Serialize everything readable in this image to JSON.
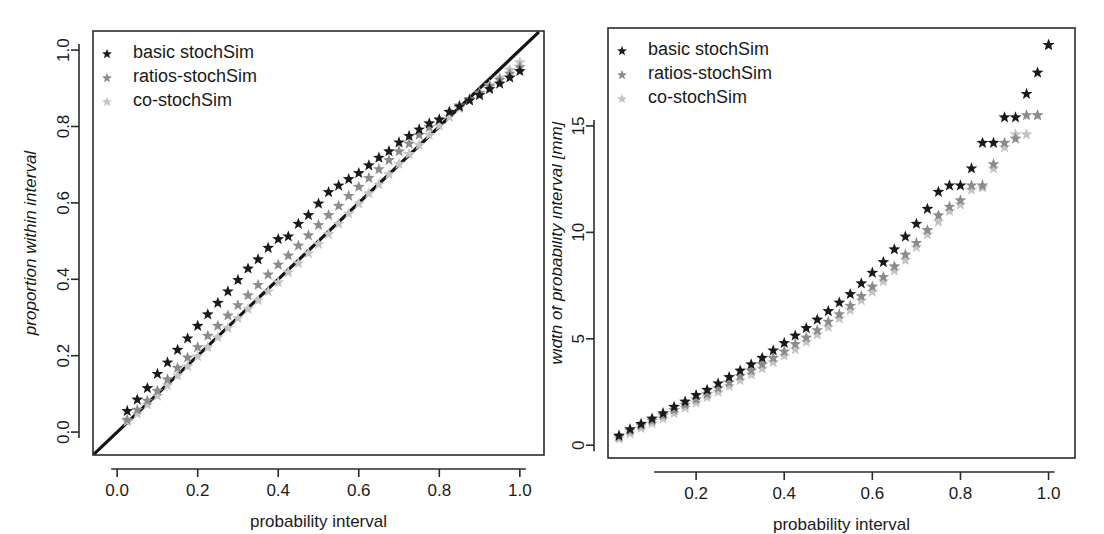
{
  "figure": {
    "background": "#ffffff",
    "panels": [
      "calibration-plot",
      "interval-width-plot"
    ]
  },
  "series_style": {
    "basic": {
      "name": "basic stochSim",
      "color": "#1a1a1a"
    },
    "ratios": {
      "name": "ratios-stochSim",
      "color": "#8c8c8c"
    },
    "co": {
      "name": "co-stochSim",
      "color": "#c4c4c4"
    }
  },
  "legend": {
    "marker": "star-marker",
    "items": [
      {
        "label": "basic stochSim",
        "color": "#1a1a1a"
      },
      {
        "label": "ratios-stochSim",
        "color": "#8c8c8c"
      },
      {
        "label": "co-stochSim",
        "color": "#c4c4c4"
      }
    ]
  },
  "chart_data": [
    {
      "id": "calibration-plot",
      "type": "scatter",
      "title": "",
      "xlabel": "probability interval",
      "ylabel": "proportion within interval",
      "xlim": [
        -0.06,
        1.06
      ],
      "ylim": [
        -0.06,
        1.05
      ],
      "xticks": [
        0.0,
        0.2,
        0.4,
        0.6,
        0.8,
        1.0
      ],
      "xticklabels": [
        "0.0",
        "0.2",
        "0.4",
        "0.6",
        "0.8",
        "1.0"
      ],
      "yticks": [
        0.0,
        0.2,
        0.4,
        0.6,
        0.8,
        1.0
      ],
      "yticklabels": [
        "0.0",
        "0.2",
        "0.4",
        "0.6",
        "0.8",
        "1.0"
      ],
      "grid": false,
      "legend_position": "top-left",
      "reference_line": {
        "name": "identity-line",
        "from": [
          -0.055,
          -0.055
        ],
        "to": [
          1.045,
          1.045
        ]
      },
      "x": [
        0.025,
        0.05,
        0.075,
        0.1,
        0.125,
        0.15,
        0.175,
        0.2,
        0.225,
        0.25,
        0.275,
        0.3,
        0.325,
        0.35,
        0.375,
        0.4,
        0.425,
        0.45,
        0.475,
        0.5,
        0.525,
        0.55,
        0.575,
        0.6,
        0.625,
        0.65,
        0.675,
        0.7,
        0.725,
        0.75,
        0.775,
        0.8,
        0.825,
        0.85,
        0.875,
        0.9,
        0.925,
        0.95,
        0.975,
        1.0
      ],
      "series": [
        {
          "name": "basic stochSim",
          "color": "#1a1a1a",
          "values": [
            0.055,
            0.085,
            0.115,
            0.152,
            0.182,
            0.215,
            0.245,
            0.278,
            0.308,
            0.338,
            0.368,
            0.398,
            0.428,
            0.452,
            0.482,
            0.505,
            0.512,
            0.545,
            0.568,
            0.598,
            0.628,
            0.645,
            0.662,
            0.678,
            0.698,
            0.718,
            0.735,
            0.758,
            0.775,
            0.792,
            0.808,
            0.818,
            0.838,
            0.852,
            0.868,
            0.882,
            0.898,
            0.912,
            0.928,
            0.945
          ]
        },
        {
          "name": "ratios-stochSim",
          "color": "#8c8c8c",
          "values": [
            0.032,
            0.058,
            0.082,
            0.108,
            0.138,
            0.168,
            0.195,
            0.222,
            0.252,
            0.278,
            0.305,
            0.332,
            0.358,
            0.385,
            0.412,
            0.438,
            0.462,
            0.488,
            0.515,
            0.542,
            0.568,
            0.592,
            0.618,
            0.642,
            0.665,
            0.688,
            0.712,
            0.735,
            0.755,
            0.778,
            0.798,
            0.818,
            0.838,
            0.855,
            0.872,
            0.888,
            0.905,
            0.922,
            0.938,
            0.955
          ]
        },
        {
          "name": "co-stochSim",
          "color": "#c4c4c4",
          "values": [
            0.028,
            0.048,
            0.072,
            0.095,
            0.122,
            0.148,
            0.172,
            0.198,
            0.222,
            0.248,
            0.272,
            0.298,
            0.322,
            0.345,
            0.368,
            0.392,
            0.418,
            0.442,
            0.468,
            0.492,
            0.518,
            0.545,
            0.572,
            0.598,
            0.625,
            0.648,
            0.675,
            0.702,
            0.728,
            0.752,
            0.778,
            0.802,
            0.825,
            0.848,
            0.868,
            0.888,
            0.908,
            0.928,
            0.948,
            0.968
          ]
        }
      ]
    },
    {
      "id": "interval-width-plot",
      "type": "scatter",
      "title": "",
      "xlabel": "probability interval",
      "ylabel": "width of probability interval [mm]",
      "xlim": [
        0.0,
        1.06
      ],
      "ylim": [
        -0.6,
        19.6
      ],
      "xticks": [
        0.2,
        0.4,
        0.6,
        0.8,
        1.0
      ],
      "xticklabels": [
        "0.2",
        "0.4",
        "0.6",
        "0.8",
        "1.0"
      ],
      "yticks": [
        0,
        5,
        10,
        15
      ],
      "yticklabels": [
        "0",
        "5",
        "10",
        "15"
      ],
      "grid": false,
      "legend_position": "top-left",
      "x": [
        0.025,
        0.05,
        0.075,
        0.1,
        0.125,
        0.15,
        0.175,
        0.2,
        0.225,
        0.25,
        0.275,
        0.3,
        0.325,
        0.35,
        0.375,
        0.4,
        0.425,
        0.45,
        0.475,
        0.5,
        0.525,
        0.55,
        0.575,
        0.6,
        0.625,
        0.65,
        0.675,
        0.7,
        0.725,
        0.75,
        0.775,
        0.8,
        0.825,
        0.85,
        0.875,
        0.9,
        0.925,
        0.95,
        0.975,
        1.0
      ],
      "series": [
        {
          "name": "basic stochSim",
          "color": "#1a1a1a",
          "values": [
            0.45,
            0.75,
            1.0,
            1.25,
            1.5,
            1.8,
            2.05,
            2.35,
            2.6,
            2.9,
            3.2,
            3.5,
            3.8,
            4.1,
            4.45,
            4.8,
            5.15,
            5.5,
            5.9,
            6.3,
            6.7,
            7.1,
            7.6,
            8.1,
            8.6,
            9.2,
            9.8,
            10.4,
            11.1,
            11.9,
            12.2,
            12.2,
            13.0,
            14.2,
            14.2,
            15.4,
            15.4,
            16.5,
            17.5,
            18.8
          ]
        },
        {
          "name": "ratios-stochSim",
          "color": "#8c8c8c",
          "values": [
            0.4,
            0.68,
            0.93,
            1.15,
            1.4,
            1.65,
            1.9,
            2.15,
            2.4,
            2.68,
            2.95,
            3.25,
            3.5,
            3.8,
            4.1,
            4.4,
            4.75,
            5.05,
            5.4,
            5.8,
            6.15,
            6.55,
            7.0,
            7.45,
            7.9,
            8.4,
            8.95,
            9.5,
            10.1,
            10.8,
            11.2,
            11.5,
            12.2,
            12.2,
            13.2,
            14.2,
            14.4,
            15.5,
            15.5,
            18.8
          ]
        },
        {
          "name": "co-stochSim",
          "color": "#c4c4c4",
          "values": [
            0.3,
            0.55,
            0.8,
            1.02,
            1.25,
            1.5,
            1.75,
            2.0,
            2.25,
            2.5,
            2.78,
            3.05,
            3.32,
            3.6,
            3.9,
            4.2,
            4.5,
            4.85,
            5.2,
            5.55,
            5.95,
            6.35,
            6.8,
            7.2,
            7.7,
            8.2,
            8.7,
            9.3,
            9.9,
            10.5,
            11.0,
            11.3,
            12.0,
            12.1,
            13.0,
            14.0,
            14.6,
            14.6,
            15.5,
            18.8
          ]
        }
      ]
    }
  ]
}
